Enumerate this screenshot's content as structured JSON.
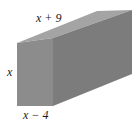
{
  "figure": {
    "type": "rectangular-prism",
    "labels": {
      "length": "x + 9",
      "height": "x",
      "width": "x − 4"
    },
    "colors": {
      "front_face": "#8a8a8a",
      "top_face": "#a4a4a4",
      "side_face": "#7c7c7c"
    }
  }
}
